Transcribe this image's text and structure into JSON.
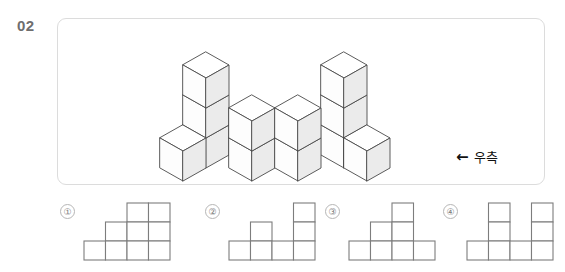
{
  "question": {
    "number": "02"
  },
  "stimulus": {
    "direction": {
      "arrow_icon": "left-arrow-icon",
      "arrow_glyph": "←",
      "label": "우측"
    },
    "figure": {
      "type": "isometric-cube-stack",
      "description": "3D block structure drawn in isometric projection",
      "colors": {
        "top_face": "#ffffff",
        "left_face": "#fdfdfd",
        "right_face": "#ebebeb",
        "outline": "#4a4a4a"
      },
      "columns": [
        {
          "col": 1,
          "row": 1,
          "height": 3
        },
        {
          "col": 1,
          "row": 2,
          "height": 1
        },
        {
          "col": 2,
          "row": 2,
          "height": 2
        },
        {
          "col": 3,
          "row": 2,
          "height": 2
        },
        {
          "col": 4,
          "row": 1,
          "height": 3
        },
        {
          "col": 4,
          "row": 2,
          "height": 1
        }
      ]
    }
  },
  "options": [
    {
      "id": "option-1",
      "marker": "①",
      "columns": [
        1,
        1,
        2,
        3
      ],
      "cols": 4,
      "rows": 3,
      "cells": [
        [
          0,
          0,
          1,
          1
        ],
        [
          0,
          1,
          1,
          1
        ],
        [
          1,
          1,
          1,
          1
        ]
      ]
    },
    {
      "id": "option-2",
      "marker": "②",
      "columns": [
        1,
        2,
        1,
        3
      ],
      "cols": 4,
      "rows": 3,
      "cells": [
        [
          0,
          0,
          0,
          1
        ],
        [
          0,
          1,
          0,
          1
        ],
        [
          1,
          1,
          1,
          1
        ]
      ]
    },
    {
      "id": "option-3",
      "marker": "③",
      "columns": [
        1,
        2,
        3,
        1
      ],
      "cols": 4,
      "rows": 3,
      "cells": [
        [
          0,
          0,
          1,
          0
        ],
        [
          0,
          1,
          1,
          0
        ],
        [
          1,
          1,
          1,
          1
        ]
      ]
    },
    {
      "id": "option-4",
      "marker": "④",
      "columns": [
        1,
        3,
        1,
        3
      ],
      "cols": 4,
      "rows": 3,
      "cells": [
        [
          0,
          1,
          0,
          1
        ],
        [
          0,
          1,
          0,
          1
        ],
        [
          1,
          1,
          1,
          1
        ]
      ]
    }
  ],
  "style": {
    "panel_border": "#dcdcdc",
    "grid_line": "#7d7d7d",
    "marker_border": "#b6b6b6",
    "marker_text": "#7a7a7a",
    "number_color": "#6e6e6e",
    "text_color": "#111111"
  }
}
